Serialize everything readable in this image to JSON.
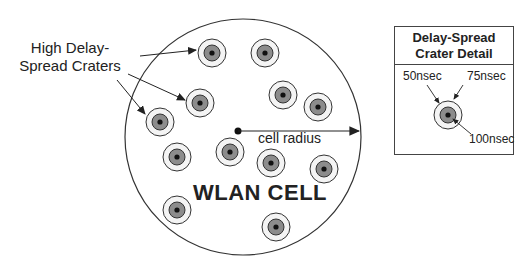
{
  "diagram": {
    "labels": {
      "craters_line1": "High Delay-",
      "craters_line2": "Spread Craters",
      "cell_radius": "cell radius",
      "cell_name": "WLAN CELL"
    },
    "detail": {
      "title_line1": "Delay-Spread",
      "title_line2": "Crater Detail",
      "inner_label": "50nsec",
      "middle_label": "75nsec",
      "outer_label": "100nsec"
    },
    "colors": {
      "line": "#333333",
      "crater_inner": "#8c8c8c",
      "crater_middle": "#e6e6e6",
      "background": "#ffffff"
    },
    "crater_count": 12
  }
}
